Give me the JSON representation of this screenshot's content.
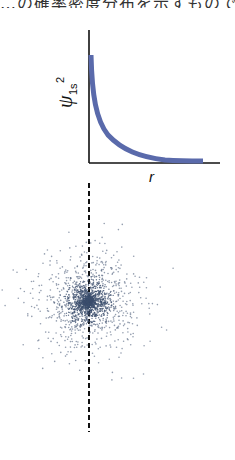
{
  "caption": {
    "text": "…の確率密度分布を示すものである。",
    "note": "clipped at top edge"
  },
  "plot": {
    "ylabel_main": "ψ",
    "ylabel_sub": "1s",
    "ylabel_sup": "2",
    "xlabel": "r",
    "curve_color": "#5a6aab",
    "axis_color": "#111111"
  },
  "cloud": {
    "dot_color": "#3c4f6e",
    "center": [
      88,
      302
    ],
    "divider": "dashed-vertical-line"
  },
  "chart_data": {
    "type": "line",
    "title": "",
    "xlabel": "r",
    "ylabel": "ψ_1s^2",
    "series": [
      {
        "name": "ψ_1s^2",
        "x": [
          0,
          0.05,
          0.1,
          0.2,
          0.3,
          0.5,
          0.75,
          1.0,
          1.5,
          2.0,
          3.0
        ],
        "values": [
          1.0,
          0.82,
          0.67,
          0.45,
          0.3,
          0.14,
          0.05,
          0.02,
          0.005,
          0.001,
          0.0
        ]
      }
    ],
    "xlim": [
      0,
      3.5
    ],
    "ylim": [
      0,
      1.2
    ],
    "grid": false,
    "legend": "none"
  }
}
